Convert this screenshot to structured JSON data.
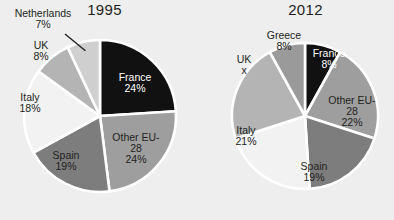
{
  "background_color": "#eeeeee",
  "palette": {
    "black": "#111111",
    "dark_gray": "#7d7d7d",
    "medium_gray": "#9e9e9e",
    "light_medium_gray": "#b4b4b4",
    "light_gray": "#cfcfcf",
    "near_white": "#f2f2f2",
    "gap": "#ffffff",
    "text": "#231f20",
    "text_on_dark": "#ffffff"
  },
  "charts": [
    {
      "id": "chart-1995",
      "title": "1995",
      "center": {
        "x": 100,
        "y": 116
      },
      "radius": 76,
      "start_angle": 0,
      "slices": [
        {
          "name": "France",
          "label": "France",
          "percent": 24,
          "value_label": "24%",
          "color": "#111111",
          "text_on_dark": true,
          "label_pos": {
            "x": 135,
            "y": 86
          },
          "leader": false
        },
        {
          "name": "Other EU-28",
          "label": "Other EU-\n28",
          "percent": 24,
          "value_label": "24%",
          "color": "#9e9e9e",
          "text_on_dark": false,
          "label_pos": {
            "x": 136,
            "y": 152
          },
          "leader": false
        },
        {
          "name": "Spain",
          "label": "Spain",
          "percent": 19,
          "value_label": "19%",
          "color": "#7d7d7d",
          "text_on_dark": false,
          "label_pos": {
            "x": 66,
            "y": 164
          },
          "leader": false
        },
        {
          "name": "Italy",
          "label": "Italy",
          "percent": 18,
          "value_label": "18%",
          "color": "#f2f2f2",
          "text_on_dark": false,
          "label_pos": {
            "x": 30,
            "y": 106
          },
          "leader": false
        },
        {
          "name": "UK",
          "label": "UK",
          "percent": 8,
          "value_label": "8%",
          "color": "#b4b4b4",
          "text_on_dark": false,
          "label_pos": {
            "x": 41,
            "y": 54
          },
          "leader": false
        },
        {
          "name": "Netherlands",
          "label": "Netherlands",
          "percent": 7,
          "value_label": "7%",
          "color": "#cfcfcf",
          "text_on_dark": false,
          "label_pos": {
            "x": 43,
            "y": 22
          },
          "leader": true
        }
      ]
    },
    {
      "id": "chart-2012",
      "title": "2012",
      "center": {
        "x": 108,
        "y": 116
      },
      "radius": 73,
      "start_angle": 0,
      "slices": [
        {
          "name": "France",
          "label": "France",
          "percent": 8,
          "value_label": "8%",
          "color": "#111111",
          "text_on_dark": true,
          "label_pos": {
            "x": 132,
            "y": 62
          },
          "leader": false
        },
        {
          "name": "Other EU-28",
          "label": "Other EU-\n28",
          "percent": 22,
          "value_label": "22%",
          "color": "#9e9e9e",
          "text_on_dark": false,
          "label_pos": {
            "x": 155,
            "y": 115
          },
          "leader": false
        },
        {
          "name": "Spain",
          "label": "Spain",
          "percent": 19,
          "value_label": "19%",
          "color": "#7d7d7d",
          "text_on_dark": false,
          "label_pos": {
            "x": 117,
            "y": 175
          },
          "leader": false
        },
        {
          "name": "Italy",
          "label": "Italy",
          "percent": 21,
          "value_label": "21%",
          "color": "#f2f2f2",
          "text_on_dark": false,
          "label_pos": {
            "x": 49,
            "y": 139
          },
          "leader": false
        },
        {
          "name": "UK",
          "label": "UK",
          "percent": 22,
          "value_label": "x",
          "color": "#b4b4b4",
          "text_on_dark": false,
          "label_pos": {
            "x": 47,
            "y": 68
          },
          "leader": false
        },
        {
          "name": "Greece",
          "label": "Greece",
          "percent": 8,
          "value_label": "8%",
          "color": "#9a9a9a",
          "text_on_dark": false,
          "label_pos": {
            "x": 87,
            "y": 44
          },
          "leader": false
        }
      ]
    }
  ],
  "chart_data": {
    "type": "pie",
    "title": "",
    "charts": [
      {
        "title": "1995",
        "labels": [
          "France",
          "Other EU-28",
          "Spain",
          "Italy",
          "UK",
          "Netherlands"
        ],
        "values": [
          24,
          24,
          19,
          18,
          8,
          7
        ],
        "value_labels": [
          "24%",
          "24%",
          "19%",
          "18%",
          "8%",
          "7%"
        ],
        "units": "percent",
        "colors": [
          "#111111",
          "#9e9e9e",
          "#7d7d7d",
          "#f2f2f2",
          "#b4b4b4",
          "#cfcfcf"
        ],
        "legend": "none",
        "labels_inline": true
      },
      {
        "title": "2012",
        "labels": [
          "France",
          "Other EU-28",
          "Spain",
          "Italy",
          "UK",
          "Greece"
        ],
        "values": [
          8,
          22,
          19,
          21,
          22,
          8
        ],
        "value_labels": [
          "8%",
          "22%",
          "19%",
          "21%",
          "x",
          "8%"
        ],
        "units": "percent",
        "colors": [
          "#111111",
          "#9e9e9e",
          "#7d7d7d",
          "#f2f2f2",
          "#b4b4b4",
          "#9a9a9a"
        ],
        "legend": "none",
        "labels_inline": true
      }
    ]
  }
}
